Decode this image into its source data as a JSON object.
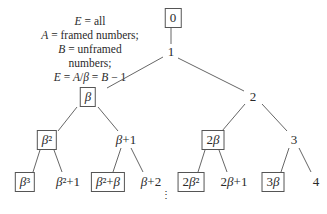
{
  "legend": {
    "lines": [
      "E = all",
      "A = framed numbers;",
      "B = unframed numbers;",
      "E = A/β = B − 1"
    ]
  },
  "tree": {
    "nodes": [
      {
        "id": "n0",
        "label": "0",
        "framed": true,
        "x": 173,
        "y": 18
      },
      {
        "id": "n1",
        "label": "1",
        "framed": false,
        "x": 171,
        "y": 52
      },
      {
        "id": "nb",
        "label": "β",
        "framed": true,
        "x": 88,
        "y": 97
      },
      {
        "id": "n2",
        "label": "2",
        "framed": false,
        "x": 253,
        "y": 97
      },
      {
        "id": "nb2",
        "label": "β²",
        "framed": true,
        "x": 47,
        "y": 140
      },
      {
        "id": "nb1",
        "label": "β+1",
        "framed": false,
        "x": 126,
        "y": 140
      },
      {
        "id": "n2b",
        "label": "2β",
        "framed": true,
        "x": 213,
        "y": 140
      },
      {
        "id": "n3",
        "label": "3",
        "framed": false,
        "x": 294,
        "y": 140
      },
      {
        "id": "nb3",
        "label": "β³",
        "framed": true,
        "x": 25,
        "y": 182
      },
      {
        "id": "nb21",
        "label": "β²+1",
        "framed": false,
        "x": 68,
        "y": 182
      },
      {
        "id": "nb2b",
        "label": "β²+β",
        "framed": true,
        "x": 108,
        "y": 182
      },
      {
        "id": "nb2p",
        "label": "β+2",
        "framed": false,
        "x": 151,
        "y": 182
      },
      {
        "id": "n2b2",
        "label": "2β²",
        "framed": true,
        "x": 191,
        "y": 182
      },
      {
        "id": "n2b1",
        "label": "2β+1",
        "framed": false,
        "x": 234,
        "y": 182
      },
      {
        "id": "n3b",
        "label": "3β",
        "framed": true,
        "x": 273,
        "y": 182
      },
      {
        "id": "n4",
        "label": "4",
        "framed": false,
        "x": 316,
        "y": 182
      }
    ],
    "continuation": "⋮"
  }
}
